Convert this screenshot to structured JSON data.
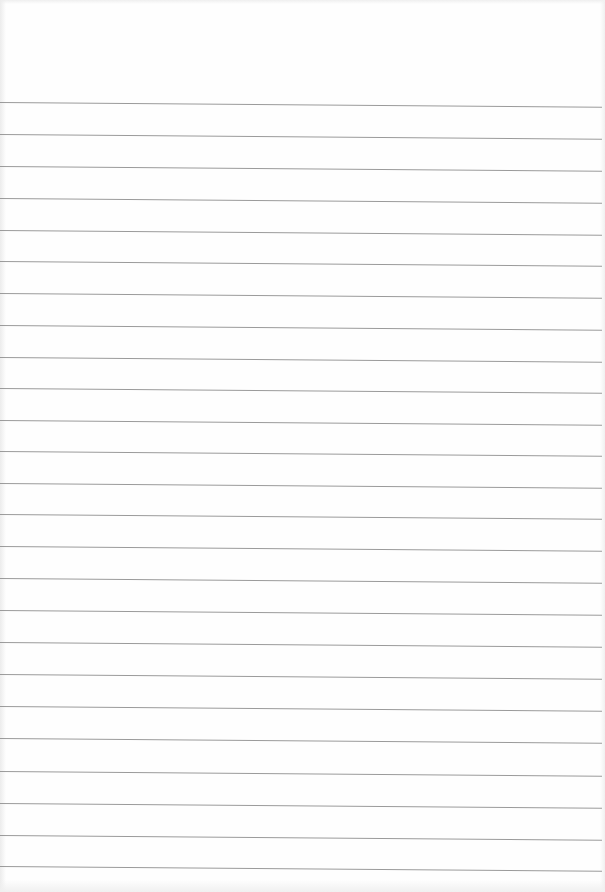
{
  "page": {
    "type": "blank ruled notebook paper",
    "background_color": "#fefefe",
    "rule_color": "#9a9a9a",
    "rule_count": 25,
    "rule_positions_y": [
      102,
      134,
      166,
      198,
      230,
      261,
      293,
      325,
      357,
      388,
      420,
      451,
      483,
      514,
      546,
      578,
      610,
      642,
      674,
      706,
      738,
      771,
      803,
      835,
      866
    ],
    "text": ""
  }
}
